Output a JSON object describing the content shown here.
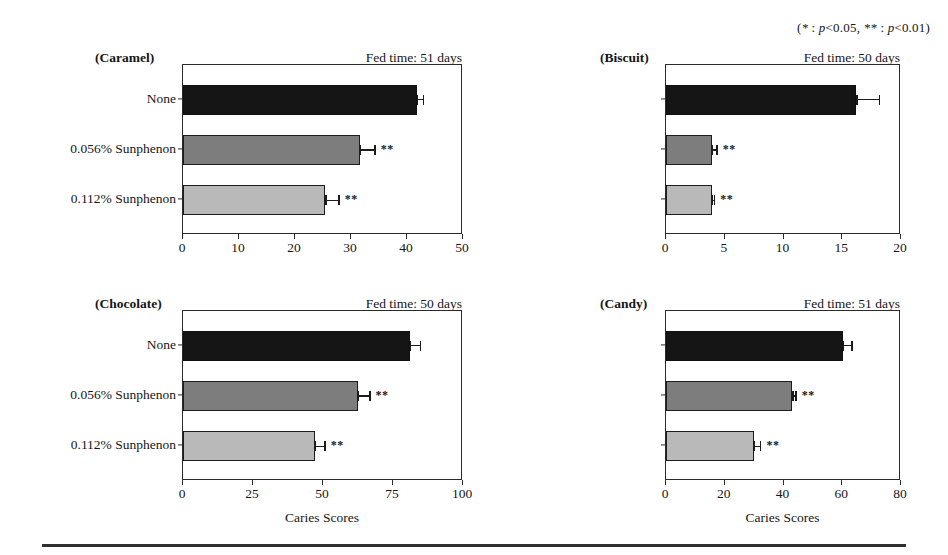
{
  "significance_legend": "(* : p<0.05, ** : p<0.01)",
  "axis_title": "Caries Scores",
  "series_shades": [
    "#151515",
    "#7d7d7d",
    "#b9b9b9"
  ],
  "chart_data": [
    {
      "type": "bar",
      "orientation": "horizontal",
      "title": "(Caramel)",
      "annotation": "Fed time: 51 days",
      "xlabel": "",
      "ylabel": "",
      "categories": [
        "None",
        "0.056% Sunphenon",
        "0.112% Sunphenon"
      ],
      "values": [
        41.8,
        31.6,
        25.4
      ],
      "errors": [
        1.2,
        2.8,
        2.6
      ],
      "significance": [
        "",
        "**",
        "**"
      ],
      "xlim": [
        0,
        50
      ],
      "xticks": [
        0,
        10,
        20,
        30,
        40,
        50
      ],
      "xticklabels": [
        "0",
        "10",
        "20",
        "30",
        "40",
        "50"
      ],
      "show_ylabels": true,
      "show_axis_title": false,
      "grid": false
    },
    {
      "type": "bar",
      "orientation": "horizontal",
      "title": "(Biscuit)",
      "annotation": "Fed time: 50 days",
      "xlabel": "",
      "ylabel": "",
      "categories": [
        "None",
        "0.056% Sunphenon",
        "0.112% Sunphenon"
      ],
      "values": [
        16.2,
        3.9,
        3.9
      ],
      "errors": [
        2.0,
        0.5,
        0.3
      ],
      "significance": [
        "",
        "**",
        "**"
      ],
      "xlim": [
        0,
        20
      ],
      "xticks": [
        0,
        5,
        10,
        15,
        20
      ],
      "xticklabels": [
        "0",
        "5",
        "10",
        "15",
        "20"
      ],
      "show_ylabels": false,
      "show_axis_title": false,
      "grid": false
    },
    {
      "type": "bar",
      "orientation": "horizontal",
      "title": "(Chocolate)",
      "annotation": "Fed time: 50 days",
      "xlabel": "Caries Scores",
      "ylabel": "",
      "categories": [
        "None",
        "0.056% Sunphenon",
        "0.112% Sunphenon"
      ],
      "values": [
        81.0,
        62.5,
        47.0
      ],
      "errors": [
        4.0,
        4.5,
        4.0
      ],
      "significance": [
        "",
        "**",
        "**"
      ],
      "xlim": [
        0,
        100
      ],
      "xticks": [
        0,
        25,
        50,
        75,
        100
      ],
      "xticklabels": [
        "0",
        "25",
        "50",
        "75",
        "100"
      ],
      "show_ylabels": true,
      "show_axis_title": true,
      "grid": false
    },
    {
      "type": "bar",
      "orientation": "horizontal",
      "title": "(Candy)",
      "annotation": "Fed time: 51 days",
      "xlabel": "Caries Scores",
      "ylabel": "",
      "categories": [
        "None",
        "0.056% Sunphenon",
        "0.112% Sunphenon"
      ],
      "values": [
        60.3,
        43.0,
        30.0
      ],
      "errors": [
        3.2,
        1.5,
        2.5
      ],
      "significance": [
        "",
        "**",
        "**"
      ],
      "xlim": [
        0,
        80
      ],
      "xticks": [
        0,
        20,
        40,
        60,
        80
      ],
      "xticklabels": [
        "0",
        "20",
        "40",
        "60",
        "80"
      ],
      "show_ylabels": false,
      "show_axis_title": true,
      "grid": false
    }
  ]
}
